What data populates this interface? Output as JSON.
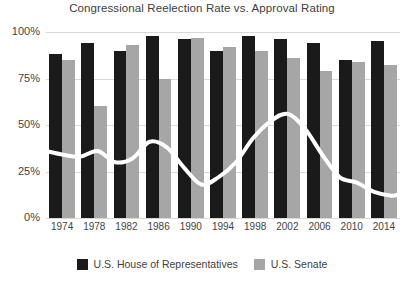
{
  "chart_data": {
    "type": "bar",
    "title": "Congressional Reelection Rate vs. Approval Rating",
    "xlabel": "",
    "ylabel": "",
    "ylim": [
      0,
      100
    ],
    "ytick_labels": [
      "100%",
      "75%",
      "50%",
      "25%",
      "0%"
    ],
    "ytick_values": [
      100,
      75,
      50,
      25,
      0
    ],
    "grid": true,
    "legend_position": "bottom",
    "categories": [
      1974,
      1978,
      1982,
      1986,
      1990,
      1994,
      1998,
      2002,
      2006,
      2010,
      2014
    ],
    "xtick_labels": [
      "1974",
      "1978",
      "1982",
      "1986",
      "1990",
      "1994",
      "1998",
      "2002",
      "2006",
      "2010",
      "2014"
    ],
    "series": [
      {
        "name": "U.S. House of Representatives",
        "type": "bar",
        "color": "#1a1a1a",
        "values": [
          88,
          94,
          90,
          98,
          96,
          90,
          98,
          96,
          94,
          85,
          95
        ]
      },
      {
        "name": "U.S. Senate",
        "type": "bar",
        "color": "#a6a6a6",
        "values": [
          85,
          60,
          93,
          75,
          97,
          92,
          90,
          86,
          79,
          84,
          82
        ]
      },
      {
        "name": "Approval Rating",
        "type": "line",
        "color": "#ffffff",
        "x": [
          1974,
          1976,
          1978,
          1980,
          1982,
          1984,
          1986,
          1988,
          1990,
          1992,
          1994,
          1996,
          1998,
          2000,
          2002,
          2004,
          2006,
          2008,
          2010,
          2012,
          2014,
          2015
        ],
        "values": [
          36,
          34,
          33,
          36,
          30,
          32,
          41,
          38,
          27,
          18,
          22,
          30,
          43,
          52,
          56,
          48,
          34,
          22,
          19,
          14,
          12,
          13
        ]
      }
    ]
  },
  "legend": {
    "items": [
      {
        "label": "U.S. House of Representatives",
        "swatch": "house"
      },
      {
        "label": "U.S. Senate",
        "swatch": "senate"
      }
    ]
  }
}
